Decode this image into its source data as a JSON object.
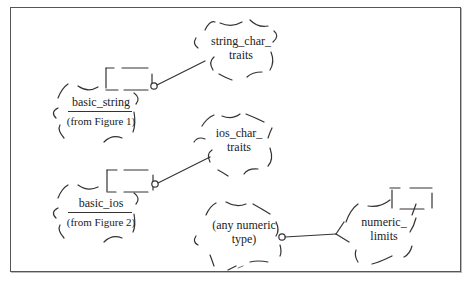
{
  "diagram": {
    "type": "booch-class-diagram",
    "classes": [
      {
        "id": "basic_string",
        "name": "basic_string",
        "note": "(from Figure 1)",
        "parameterized": true
      },
      {
        "id": "string_char_traits",
        "name_line1": "string_char_",
        "name_line2": "traits",
        "parameterized": false
      },
      {
        "id": "basic_ios",
        "name": "basic_ios",
        "note": "(from Figure 2)",
        "parameterized": true
      },
      {
        "id": "ios_char_traits",
        "name_line1": "ios_char_",
        "name_line2": "traits",
        "parameterized": false
      },
      {
        "id": "any_numeric_type",
        "name_line1": "(any numeric",
        "name_line2": "type)",
        "parameterized": false
      },
      {
        "id": "numeric_limits",
        "name_line1": "numeric_",
        "name_line2": "limits",
        "parameterized": true
      }
    ],
    "relationships": [
      {
        "from": "basic_string",
        "to": "string_char_traits",
        "kind": "uses"
      },
      {
        "from": "basic_ios",
        "to": "ios_char_traits",
        "kind": "uses"
      },
      {
        "from": "any_numeric_type",
        "to": "numeric_limits",
        "kind": "uses"
      }
    ],
    "colors": {
      "stroke": "#333333",
      "background": "#ffffff",
      "frame": "#555555"
    }
  }
}
